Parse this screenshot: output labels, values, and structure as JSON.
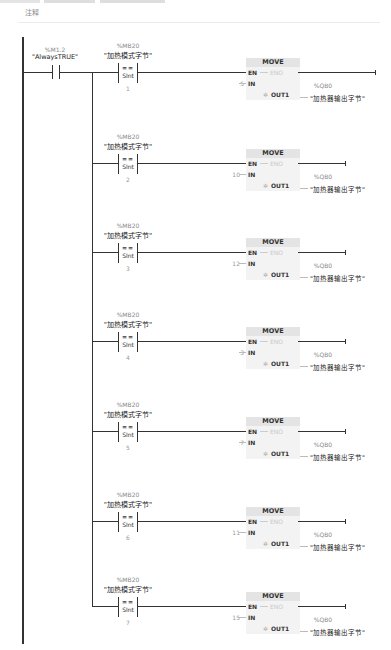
{
  "header": {
    "comment_label": "注释"
  },
  "first_contact": {
    "address": "%M1.2",
    "symbol": "\"AlwaysTRUE\""
  },
  "rungs": [
    {
      "cmp_address": "%MB20",
      "cmp_symbol": "\"加热模式字节\"",
      "cmp_op": "==",
      "cmp_type": "SInt",
      "cmp_value": "1",
      "block": "MOVE",
      "en": "EN",
      "eno": "ENO",
      "in_pin": "IN",
      "in_value": "5",
      "out_pin": "OUT1",
      "out_address": "%QB0",
      "out_symbol": "\"加热器输出字节\""
    },
    {
      "cmp_address": "%MB20",
      "cmp_symbol": "\"加热模式字节\"",
      "cmp_op": "==",
      "cmp_type": "SInt",
      "cmp_value": "2",
      "block": "MOVE",
      "en": "EN",
      "eno": "ENO",
      "in_pin": "IN",
      "in_value": "10",
      "out_pin": "OUT1",
      "out_address": "%QB0",
      "out_symbol": "\"加热器输出字节\""
    },
    {
      "cmp_address": "%MB20",
      "cmp_symbol": "\"加热模式字节\"",
      "cmp_op": "==",
      "cmp_type": "SInt",
      "cmp_value": "3",
      "block": "MOVE",
      "en": "EN",
      "eno": "ENO",
      "in_pin": "IN",
      "in_value": "12",
      "out_pin": "OUT1",
      "out_address": "%QB0",
      "out_symbol": "\"加热器输出字节\""
    },
    {
      "cmp_address": "%MB20",
      "cmp_symbol": "\"加热模式字节\"",
      "cmp_op": "==",
      "cmp_type": "SInt",
      "cmp_value": "4",
      "block": "MOVE",
      "en": "EN",
      "eno": "ENO",
      "in_pin": "IN",
      "in_value": "3",
      "out_pin": "OUT1",
      "out_address": "%QB0",
      "out_symbol": "\"加热器输出字节\""
    },
    {
      "cmp_address": "%MB20",
      "cmp_symbol": "\"加热模式字节\"",
      "cmp_op": "==",
      "cmp_type": "SInt",
      "cmp_value": "5",
      "block": "MOVE",
      "en": "EN",
      "eno": "ENO",
      "in_pin": "IN",
      "in_value": "7",
      "out_pin": "OUT1",
      "out_address": "%QB0",
      "out_symbol": "\"加热器输出字节\""
    },
    {
      "cmp_address": "%MB20",
      "cmp_symbol": "\"加热模式字节\"",
      "cmp_op": "==",
      "cmp_type": "SInt",
      "cmp_value": "6",
      "block": "MOVE",
      "en": "EN",
      "eno": "ENO",
      "in_pin": "IN",
      "in_value": "11",
      "out_pin": "OUT1",
      "out_address": "%QB0",
      "out_symbol": "\"加热器输出字节\""
    },
    {
      "cmp_address": "%MB20",
      "cmp_symbol": "\"加热模式字节\"",
      "cmp_op": "==",
      "cmp_type": "SInt",
      "cmp_value": "7",
      "block": "MOVE",
      "en": "EN",
      "eno": "ENO",
      "in_pin": "IN",
      "in_value": "15",
      "out_pin": "OUT1",
      "out_address": "%QB0",
      "out_symbol": "\"加热器输出字节\""
    }
  ],
  "colors": {
    "wire": "#333333",
    "block_bg": "#f3f3f3",
    "block_header": "#e4e4e4",
    "label_gray": "#888888"
  }
}
